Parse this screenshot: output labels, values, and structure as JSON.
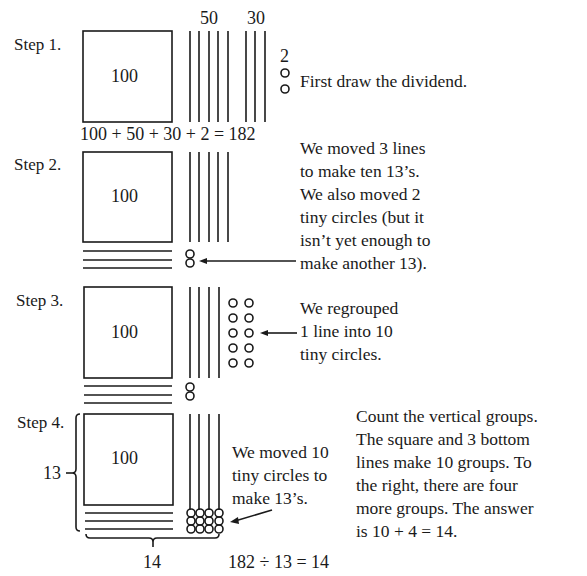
{
  "colors": {
    "ink": "#1a1a1a",
    "background": "#ffffff"
  },
  "steps": [
    {
      "label": "Step 1.",
      "square_value": "100",
      "top_labels": [
        "50",
        "30"
      ],
      "circle_label": "2",
      "note": "First draw the dividend.",
      "equation": "100 + 50 + 30 + 2 = 182",
      "vertical_lines": 8,
      "circles": 2
    },
    {
      "label": "Step 2.",
      "square_value": "100",
      "note": "We moved 3 lines\nto make ten 13’s.\nWe also moved 2\ntiny circles (but it\nisn’t yet enough to\nmake another 13).",
      "vertical_lines": 5,
      "horizontal_lines": 3,
      "circles": 2
    },
    {
      "label": "Step 3.",
      "square_value": "100",
      "note": "We regrouped\n1 line into 10\ntiny circles.",
      "vertical_lines": 4,
      "horizontal_lines": 3,
      "circles": 12
    },
    {
      "label": "Step 4.",
      "square_value": "100",
      "note": "We moved 10\ntiny circles to\nmake 13’s.",
      "side_note": "Count the vertical groups.\nThe square and 3 bottom\nlines make 10 groups. To\nthe right, there are four\nmore groups. The answer\nis 10 + 4 = 14.",
      "divisor_label": "13",
      "quotient_label": "14",
      "result": "182 ÷ 13 = 14",
      "vertical_lines": 4,
      "horizontal_lines": 3,
      "circles": 12
    }
  ]
}
